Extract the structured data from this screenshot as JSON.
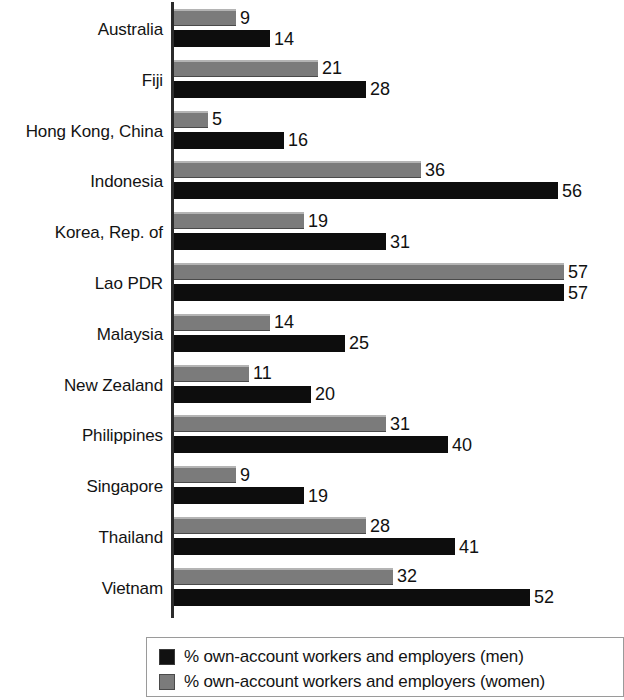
{
  "chart_data": {
    "type": "bar",
    "orientation": "horizontal",
    "title": "",
    "xlabel": "",
    "ylabel": "",
    "xlim": [
      0,
      57
    ],
    "grid": false,
    "legend_position": "bottom",
    "categories": [
      "Australia",
      "Fiji",
      "Hong Kong, China",
      "Indonesia",
      "Korea, Rep. of",
      "Lao PDR",
      "Malaysia",
      "New Zealand",
      "Philippines",
      "Singapore",
      "Thailand",
      "Vietnam"
    ],
    "series": [
      {
        "name": "% own-account workers and employers (women)",
        "key": "women",
        "color": "#7b7b7b",
        "values": [
          9,
          21,
          5,
          36,
          19,
          57,
          14,
          11,
          31,
          9,
          28,
          32
        ]
      },
      {
        "name": "% own-account workers and employers (men)",
        "key": "men",
        "color": "#0d0d0d",
        "values": [
          14,
          28,
          16,
          56,
          31,
          57,
          25,
          20,
          40,
          19,
          41,
          52
        ]
      }
    ]
  },
  "legend": {
    "items": [
      {
        "label": "% own-account workers and employers (men)",
        "swatch": "men"
      },
      {
        "label": "% own-account workers and employers (women)",
        "swatch": "women"
      }
    ]
  },
  "layout": {
    "axis_x": 171,
    "bar_origin_x": 174,
    "px_per_unit": 6.85,
    "row_pitch": 50.8,
    "first_row_top": 8
  }
}
